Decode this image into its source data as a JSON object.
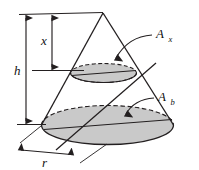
{
  "figure": {
    "name": "cone-cross-section-diagram",
    "type": "geometric-diagram",
    "background_color": "#ffffff",
    "line_color": "#231f20",
    "fill_color": "#c9c9c9",
    "labels": {
      "height": "h",
      "distance_from_apex": "x",
      "radius": "r",
      "cross_section_area_main": "A",
      "cross_section_area_sub": "x",
      "base_area_main": "A",
      "base_area_sub": "b"
    },
    "elements": {
      "apex": "cone-apex",
      "base_ellipse": "base-ellipse",
      "cross_ellipse": "cross-section-ellipse",
      "left_slant": "cone-left-slant-edge",
      "right_slant": "cone-right-slant-edge",
      "diagonal": "cone-diagonal-slant-line",
      "h_dimension": "height-dimension-line",
      "x_dimension": "x-dimension-line",
      "r_dimension": "radius-dimension-line",
      "leader_ax": "leader-line-ax",
      "leader_ab": "leader-line-ab"
    }
  }
}
